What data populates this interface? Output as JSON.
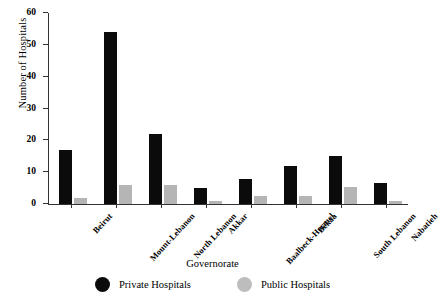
{
  "chart_data": {
    "type": "bar",
    "title": "",
    "xlabel": "Governorate",
    "ylabel": "Number of Hospitals",
    "ylim": [
      0,
      60
    ],
    "yticks": [
      0,
      10,
      20,
      30,
      40,
      50,
      60
    ],
    "ytick_labels": [
      "0",
      "10",
      "20",
      "30",
      "40",
      "50",
      "60"
    ],
    "grid": false,
    "legend_position": "bottom",
    "categories": [
      "Beirut",
      "Mount-Lebanon",
      "North Lebanon",
      "Akkar",
      "Baalbeck-Hermel",
      "Bekaa",
      "South Lebanon",
      "Nabatieh"
    ],
    "series": [
      {
        "name": "Private Hospitals",
        "color": "#0b0b0b",
        "values": [
          17,
          54,
          22,
          5,
          8,
          12,
          15,
          6.5
        ]
      },
      {
        "name": "Public Hospitals",
        "color": "#b5b5b5",
        "values": [
          2,
          6,
          6,
          1,
          2.5,
          2.5,
          5.5,
          1
        ]
      }
    ]
  },
  "legend": {
    "items": [
      {
        "label": "Private Hospitals",
        "marker": "filled-circle-black"
      },
      {
        "label": "Public Hospitals",
        "marker": "filled-circle-gray"
      }
    ]
  }
}
